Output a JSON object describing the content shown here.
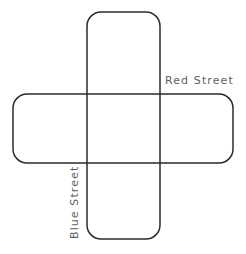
{
  "figure": {
    "type": "street-intersection-diagram",
    "background_color": "#ffffff",
    "stroke_color": "#2b2b2b",
    "label_color": "#5e5e5e"
  },
  "labels": {
    "red_street": "Red Street",
    "blue_street": "Blue Street"
  },
  "shapes": {
    "vertical_street": {
      "name": "Blue Street",
      "x": 87,
      "y": 12,
      "width": 73,
      "height": 227,
      "corner_radius": 14
    },
    "horizontal_street": {
      "name": "Red Street",
      "x": 13,
      "y": 94,
      "width": 220,
      "height": 69,
      "corner_radius": 14
    }
  }
}
